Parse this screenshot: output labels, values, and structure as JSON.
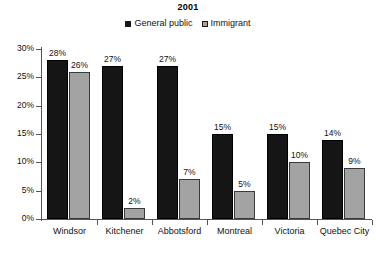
{
  "chart_data": {
    "type": "bar",
    "title": "2001",
    "xlabel": "",
    "ylabel": "",
    "ylim": [
      0,
      30
    ],
    "ytick_labels": [
      "30%",
      "25%",
      "20%",
      "15%",
      "10%",
      "5%",
      "0%"
    ],
    "ytick_values": [
      30,
      25,
      20,
      15,
      10,
      5,
      0
    ],
    "grid": false,
    "legend_position": "top-center",
    "categories": [
      "Windsor",
      "Kitchener",
      "Abbotsford",
      "Montreal",
      "Victoria",
      "Quebec City"
    ],
    "series": [
      {
        "name": "General public",
        "color": "#151515",
        "values": [
          28,
          27,
          27,
          15,
          15,
          14
        ],
        "value_labels": [
          "28%",
          "27%",
          "27%",
          "15%",
          "15%",
          "14%"
        ]
      },
      {
        "name": "Immigrant",
        "color": "#a3a3a3",
        "values": [
          26,
          2,
          7,
          5,
          10,
          9
        ],
        "value_labels": [
          "26%",
          "2%",
          "7%",
          "5%",
          "10%",
          "9%"
        ]
      }
    ]
  },
  "legend": {
    "items": [
      {
        "label": "General public",
        "color": "#151515"
      },
      {
        "label": "Immigrant",
        "color": "#a3a3a3"
      }
    ]
  }
}
